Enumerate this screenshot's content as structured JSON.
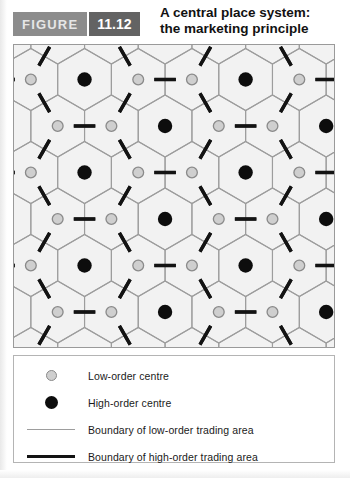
{
  "header": {
    "badge_label": "FIGURE",
    "figure_number": "11.12",
    "title_line1": "A central place system:",
    "title_line2": "the marketing principle"
  },
  "legend": {
    "items": [
      {
        "marker": "low-order-centre-dot",
        "label": "Low-order centre"
      },
      {
        "marker": "high-order-centre-dot",
        "label": "High-order centre"
      },
      {
        "marker": "thin-line",
        "label": "Boundary of low-order trading area"
      },
      {
        "marker": "thick-line",
        "label": "Boundary of high-order trading area"
      }
    ]
  },
  "colors": {
    "map_background": "#f2f2f2",
    "thin_boundary": "#9d9d9d",
    "thick_boundary": "#131313",
    "low_order_fill": "#cfcfcf",
    "low_order_stroke": "#8a8a8a",
    "high_order_fill": "#0d0d0d",
    "badge_figure_bg": "#8c8c8c",
    "badge_number_bg": "#636363"
  },
  "chart_data": {
    "type": "diagram",
    "title": "A central place system: the marketing principle",
    "geometry": {
      "hex_circumradius": 31,
      "orientation": "pointy-top",
      "col_pitch_x": 54,
      "row_pitch_y": 93,
      "map_width": 322,
      "map_height": 304
    },
    "low_order_centres_count": 36,
    "high_order_centres_count": 16,
    "k_value": 3
  }
}
